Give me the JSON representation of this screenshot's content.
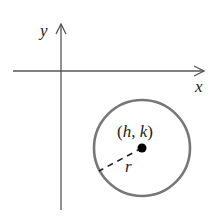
{
  "diagram": {
    "type": "coordinate-plane-circle",
    "axes": {
      "x_label": "x",
      "y_label": "y",
      "color": "#555555"
    },
    "circle": {
      "center_label": "(h, k)",
      "radius_label": "r",
      "stroke_color": "#777777",
      "center_color": "#000000"
    }
  }
}
